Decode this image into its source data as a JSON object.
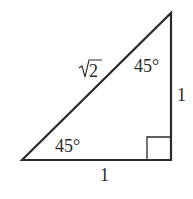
{
  "diagram": {
    "type": "right-isosceles-triangle",
    "hypotenuse_label": "2",
    "hypotenuse_radical": "√",
    "top_angle_label": "45°",
    "bottom_angle_label": "45°",
    "vertical_leg_label": "1",
    "horizontal_leg_label": "1",
    "right_angle_marker": true,
    "stroke_color": "#2a2a2a",
    "background": "#ffffff"
  }
}
